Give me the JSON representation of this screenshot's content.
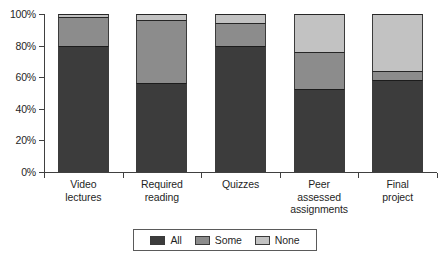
{
  "chart_data": {
    "type": "bar",
    "subtype": "stacked-100-percent",
    "title": "",
    "xlabel": "",
    "ylabel": "",
    "ylim": [
      0,
      100
    ],
    "yticks": [
      0,
      20,
      40,
      60,
      80,
      100
    ],
    "ytick_labels": [
      "0%",
      "20%",
      "40%",
      "60%",
      "80%",
      "100%"
    ],
    "grid": false,
    "legend_position": "bottom",
    "categories": [
      "Video lectures",
      "Required reading",
      "Quizzes",
      "Peer assessed assignments",
      "Final project"
    ],
    "category_lines": [
      [
        "Video",
        "lectures"
      ],
      [
        "Required",
        "reading"
      ],
      [
        "Quizzes"
      ],
      [
        "Peer",
        "assessed",
        "assignments"
      ],
      [
        "Final",
        "project"
      ]
    ],
    "series": [
      {
        "name": "All",
        "color": "#3c3c3c",
        "values": [
          80,
          56.5,
          79.5,
          52.5,
          58
        ]
      },
      {
        "name": "Some",
        "color": "#8c8c8c",
        "values": [
          18,
          39.5,
          15,
          23.5,
          6
        ]
      },
      {
        "name": "None",
        "color": "#c2c2c2",
        "values": [
          2,
          4,
          5.5,
          24,
          36
        ]
      }
    ]
  },
  "axis": {
    "tick_labels": [
      "100%",
      "80%",
      "60%",
      "40%",
      "20%",
      "0%"
    ]
  },
  "legend": {
    "entries": [
      {
        "label": "All",
        "key": "all"
      },
      {
        "label": "Some",
        "key": "some"
      },
      {
        "label": "None",
        "key": "none"
      }
    ]
  },
  "colors": {
    "all": "#3c3c3c",
    "some": "#8c8c8c",
    "none": "#c2c2c2",
    "axis": "#404040",
    "background": "#ffffff",
    "text": "#1f1f1f"
  }
}
